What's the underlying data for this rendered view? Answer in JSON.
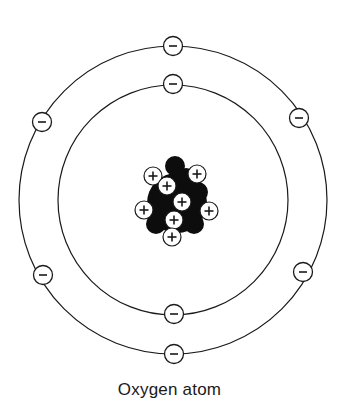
{
  "title": "Oxygen atom",
  "colors": {
    "line": "#1a1a1a",
    "neutron": "#0d0d0d",
    "background": "#ffffff"
  },
  "atom": {
    "center": [
      173,
      200
    ],
    "nucleus": {
      "protons_label": "+",
      "proton_count": 8,
      "neutron_count": 8,
      "protons": [
        [
          153,
          176
        ],
        [
          197,
          174
        ],
        [
          167,
          186
        ],
        [
          182,
          202
        ],
        [
          144,
          210
        ],
        [
          209,
          211
        ],
        [
          174,
          220
        ],
        [
          172,
          237
        ]
      ],
      "neutrons": [
        [
          175,
          166
        ],
        [
          186,
          178
        ],
        [
          162,
          198
        ],
        [
          198,
          192
        ],
        [
          156,
          224
        ],
        [
          194,
          224
        ],
        [
          188,
          214
        ],
        [
          168,
          208
        ]
      ]
    },
    "shells": [
      {
        "name": "inner",
        "radius": 115,
        "electron_label": "−",
        "electrons": [
          [
            173,
            84
          ],
          [
            174,
            314
          ]
        ]
      },
      {
        "name": "outer",
        "radius": 154,
        "electron_label": "−",
        "electrons": [
          [
            173,
            46
          ],
          [
            42,
            122
          ],
          [
            299,
            118
          ],
          [
            43,
            275
          ],
          [
            303,
            272
          ],
          [
            174,
            354
          ]
        ]
      }
    ]
  }
}
